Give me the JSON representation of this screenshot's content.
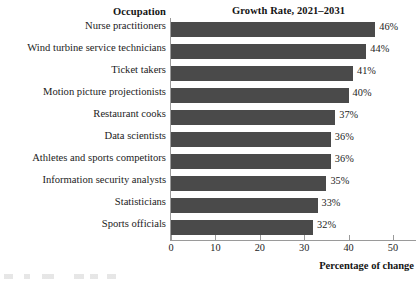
{
  "headers": {
    "left": "Occupation",
    "right": "Growth Rate, 2021–2031"
  },
  "axis": {
    "x_title": "Percentage of change",
    "ticks": [
      "0",
      "10",
      "20",
      "30",
      "40",
      "50"
    ]
  },
  "colors": {
    "bar": "#4a4a4a",
    "axis": "#9a9a9a",
    "text": "#1c1c1c"
  },
  "chart_data": {
    "type": "bar",
    "orientation": "horizontal",
    "title": "Growth Rate, 2021–2031",
    "xlabel": "Percentage of change",
    "ylabel": "Occupation",
    "xlim": [
      0,
      55
    ],
    "xticks": [
      0,
      10,
      20,
      30,
      40,
      50
    ],
    "grid": false,
    "legend": "none",
    "categories": [
      "Nurse practitioners",
      "Wind turbine service technicians",
      "Ticket takers",
      "Motion picture projectionists",
      "Restaurant cooks",
      "Data scientists",
      "Athletes and sports competitors",
      "Information security analysts",
      "Statisticians",
      "Sports officials"
    ],
    "values": [
      46,
      44,
      41,
      40,
      37,
      36,
      36,
      35,
      33,
      32
    ],
    "value_labels": [
      "46%",
      "44%",
      "41%",
      "40%",
      "37%",
      "36%",
      "36%",
      "35%",
      "33%",
      "32%"
    ]
  }
}
